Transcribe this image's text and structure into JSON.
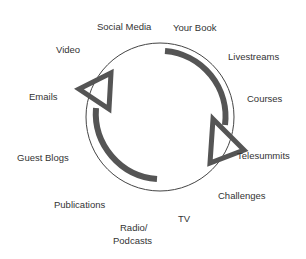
{
  "diagram": {
    "type": "cycle",
    "colors": {
      "stroke": "#555555",
      "thin": "#444444",
      "text": "#333333"
    },
    "labels": [
      {
        "id": "social-media",
        "text": "Social Media",
        "x": 97,
        "y": 21
      },
      {
        "id": "your-book",
        "text": "Your Book",
        "x": 173,
        "y": 22
      },
      {
        "id": "video",
        "text": "Video",
        "x": 56,
        "y": 44
      },
      {
        "id": "livestreams",
        "text": "Livestreams",
        "x": 228,
        "y": 51
      },
      {
        "id": "emails",
        "text": "Emails",
        "x": 29,
        "y": 91
      },
      {
        "id": "courses",
        "text": "Courses",
        "x": 247,
        "y": 93
      },
      {
        "id": "telesummits",
        "text": "Telesummits",
        "x": 237,
        "y": 150
      },
      {
        "id": "guest-blogs",
        "text": "Guest Blogs",
        "x": 17,
        "y": 152
      },
      {
        "id": "challenges",
        "text": "Challenges",
        "x": 218,
        "y": 190
      },
      {
        "id": "publications",
        "text": "Publications",
        "x": 54,
        "y": 199
      },
      {
        "id": "tv",
        "text": "TV",
        "x": 178,
        "y": 213
      },
      {
        "id": "radio",
        "text": "Radio/",
        "x": 120,
        "y": 222
      },
      {
        "id": "podcasts",
        "text": "Podcasts",
        "x": 113,
        "y": 235
      }
    ]
  }
}
